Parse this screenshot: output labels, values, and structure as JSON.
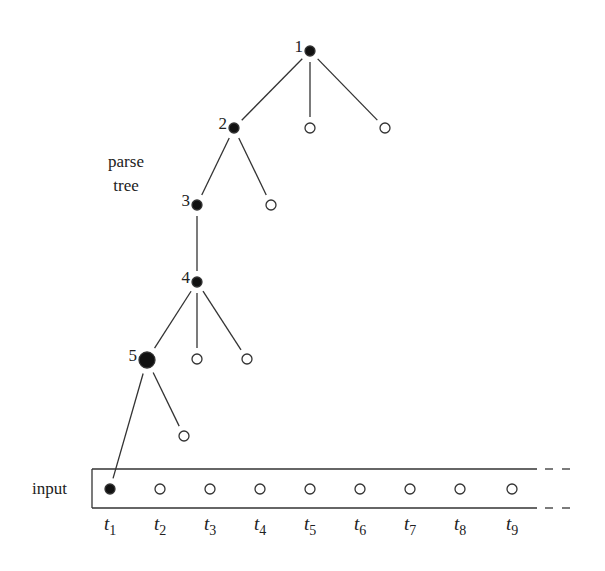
{
  "diagram": {
    "type": "parse-tree-over-input",
    "labels": {
      "parse_tree": [
        "parse",
        "tree"
      ],
      "input": "input"
    },
    "colors": {
      "ink": "#222222",
      "background": "#ffffff"
    },
    "tree_nodes": [
      {
        "id": "n1",
        "label": "1",
        "filled": true,
        "x": 310,
        "y": 51,
        "r": 5
      },
      {
        "id": "n1c2",
        "label": "",
        "filled": false,
        "x": 310,
        "y": 128,
        "r": 5
      },
      {
        "id": "n1c3",
        "label": "",
        "filled": false,
        "x": 385,
        "y": 128,
        "r": 5
      },
      {
        "id": "n2",
        "label": "2",
        "filled": true,
        "x": 234,
        "y": 128,
        "r": 5
      },
      {
        "id": "n2c2",
        "label": "",
        "filled": false,
        "x": 271,
        "y": 205,
        "r": 5
      },
      {
        "id": "n3",
        "label": "3",
        "filled": true,
        "x": 197,
        "y": 205,
        "r": 5
      },
      {
        "id": "n4",
        "label": "4",
        "filled": true,
        "x": 197,
        "y": 282,
        "r": 5
      },
      {
        "id": "n4c2",
        "label": "",
        "filled": false,
        "x": 197,
        "y": 359,
        "r": 5
      },
      {
        "id": "n4c3",
        "label": "",
        "filled": false,
        "x": 247,
        "y": 359,
        "r": 5
      },
      {
        "id": "n5",
        "label": "5",
        "filled": true,
        "x": 147,
        "y": 360,
        "r": 8
      },
      {
        "id": "n5c2",
        "label": "",
        "filled": false,
        "x": 184,
        "y": 436,
        "r": 5
      }
    ],
    "edges": [
      {
        "from": "n1",
        "to": "n2"
      },
      {
        "from": "n1",
        "to": "n1c2"
      },
      {
        "from": "n1",
        "to": "n1c3"
      },
      {
        "from": "n2",
        "to": "n3"
      },
      {
        "from": "n2",
        "to": "n2c2"
      },
      {
        "from": "n3",
        "to": "n4"
      },
      {
        "from": "n4",
        "to": "n5"
      },
      {
        "from": "n4",
        "to": "n4c2"
      },
      {
        "from": "n4",
        "to": "n4c3"
      },
      {
        "from": "n5",
        "to": "t1"
      },
      {
        "from": "n5",
        "to": "n5c2"
      }
    ],
    "input_tokens": [
      {
        "id": "t1",
        "name": "t",
        "sub": "1",
        "filled": true,
        "x": 110
      },
      {
        "id": "t2",
        "name": "t",
        "sub": "2",
        "filled": false,
        "x": 160
      },
      {
        "id": "t3",
        "name": "t",
        "sub": "3",
        "filled": false,
        "x": 210
      },
      {
        "id": "t4",
        "name": "t",
        "sub": "4",
        "filled": false,
        "x": 260
      },
      {
        "id": "t5",
        "name": "t",
        "sub": "5",
        "filled": false,
        "x": 310
      },
      {
        "id": "t6",
        "name": "t",
        "sub": "6",
        "filled": false,
        "x": 360
      },
      {
        "id": "t7",
        "name": "t",
        "sub": "7",
        "filled": false,
        "x": 410
      },
      {
        "id": "t8",
        "name": "t",
        "sub": "8",
        "filled": false,
        "x": 460
      },
      {
        "id": "t9",
        "name": "t",
        "sub": "9",
        "filled": false,
        "x": 512
      }
    ]
  }
}
